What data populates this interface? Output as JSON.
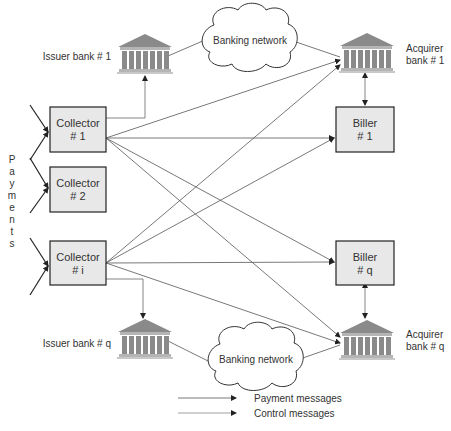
{
  "diagram": {
    "side_label_letters": [
      "P",
      "a",
      "y",
      "m",
      "e",
      "n",
      "t",
      "s"
    ],
    "collectors": [
      {
        "title": "Collector",
        "num": "# 1"
      },
      {
        "title": "Collector",
        "num": "# 2"
      },
      {
        "title": "Collector",
        "num": "# i"
      }
    ],
    "billers": [
      {
        "title": "Biller",
        "num": "# 1"
      },
      {
        "title": "Biller",
        "num": "# q"
      }
    ],
    "issuer_banks": [
      {
        "label": "Issuer bank # 1"
      },
      {
        "label": "Issuer bank # q"
      }
    ],
    "acquirer_banks": [
      {
        "line1": "Acquirer",
        "line2": "bank # 1"
      },
      {
        "line1": "Acquirer",
        "line2": "bank # q"
      }
    ],
    "clouds": [
      {
        "label": "Banking network"
      },
      {
        "label": "Banking network"
      }
    ],
    "legend": [
      {
        "label": "Payment messages"
      },
      {
        "label": "Control messages"
      }
    ],
    "colors": {
      "box_fill": "#e8e8e8",
      "box_stroke": "#222222",
      "bank_fill": "#8a8a8a",
      "line": "#555555"
    }
  }
}
